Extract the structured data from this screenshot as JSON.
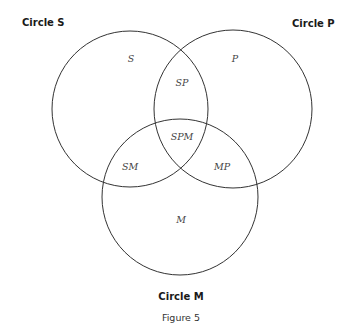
{
  "diagram": {
    "type": "venn",
    "caption": "Figure 5",
    "circles": [
      {
        "id": "S",
        "title": "Circle S",
        "cx": 130,
        "cy": 109,
        "r": 78
      },
      {
        "id": "P",
        "title": "Circle P",
        "cx": 233,
        "cy": 109,
        "r": 79
      },
      {
        "id": "M",
        "title": "Circle M",
        "cx": 180,
        "cy": 197,
        "r": 78
      }
    ],
    "regions": {
      "S": "S",
      "P": "P",
      "SP": "SP",
      "SPM": "SPM",
      "SM": "SM",
      "MP": "MP",
      "M": "M"
    },
    "colors": {
      "stroke": "#333333",
      "background": "#ffffff",
      "title": "#1a1a1a",
      "region_label": "#444444"
    }
  }
}
